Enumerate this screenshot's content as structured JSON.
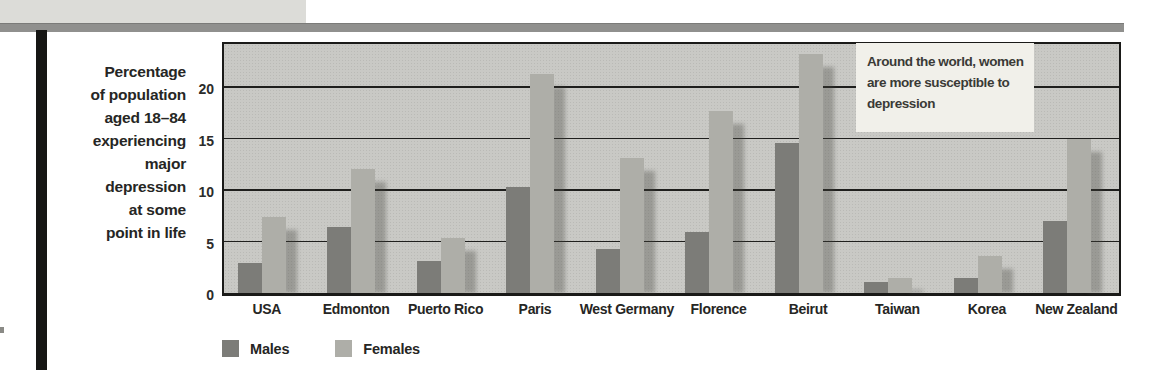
{
  "page": {
    "background": "#ffffff",
    "top_rule_color": "#90908e",
    "corner_block_color": "#dcdcd8",
    "spine_bar_color": "#161614"
  },
  "chart_data": {
    "type": "bar",
    "title": "",
    "ylabel": "Percentage\nof population\naged 18–84\nexperiencing\nmajor\ndepression\nat some\npoint in life",
    "xlabel": "",
    "categories": [
      "USA",
      "Edmonton",
      "Puerto Rico",
      "Paris",
      "West Germany",
      "Florence",
      "Beirut",
      "Taiwan",
      "Korea",
      "New Zealand"
    ],
    "series": [
      {
        "name": "Males",
        "color": "#7c7c78",
        "values": [
          2.9,
          6.4,
          3.1,
          10.3,
          4.3,
          5.9,
          14.6,
          1.1,
          1.5,
          7.0
        ]
      },
      {
        "name": "Females",
        "color": "#aeaea8",
        "values": [
          7.4,
          12.1,
          5.3,
          21.3,
          13.1,
          17.7,
          23.2,
          1.5,
          3.6,
          15.0
        ]
      }
    ],
    "yticks": [
      0,
      5,
      10,
      15,
      20
    ],
    "ylim": [
      0,
      24.2
    ],
    "grid": true,
    "legend_position": "bottom-left",
    "plot_bg": "#c9c9c5",
    "annotation": {
      "text": "Around the world, women\nare more susceptible to\ndepression",
      "bg": "#f1f0ea"
    }
  }
}
